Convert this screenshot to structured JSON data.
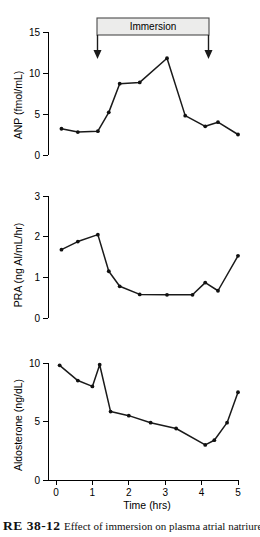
{
  "figure": {
    "caption_number": "RE 38-12",
    "caption_body": "Effect of immersion on plasma atrial natriuretic"
  },
  "annotation": {
    "immersion_label": "Immersion",
    "immersion_start_hr": 1.15,
    "immersion_end_hr": 4.2,
    "arrow_down_icon": "arrow-down-icon"
  },
  "shared_axis": {
    "xlabel": "Time (hrs)",
    "xticks": [
      0,
      1,
      2,
      3,
      4,
      5
    ],
    "xlim": [
      0,
      5
    ]
  },
  "chart_data": [
    {
      "type": "line",
      "title": "",
      "panel": "ANP",
      "xlabel": "",
      "ylabel": "ANP (fmol/mL)",
      "ylim": [
        0,
        15
      ],
      "yticks": [
        0,
        5,
        10,
        15
      ],
      "xlim": [
        0,
        5
      ],
      "grid": false,
      "legend": "none",
      "x": [
        0.15,
        0.6,
        1.15,
        1.45,
        1.75,
        2.3,
        3.05,
        3.55,
        4.1,
        4.45,
        5.0
      ],
      "values": [
        3.2,
        2.8,
        2.9,
        5.2,
        8.7,
        8.85,
        11.8,
        4.8,
        3.5,
        4.0,
        2.5
      ]
    },
    {
      "type": "line",
      "title": "",
      "panel": "PRA",
      "xlabel": "",
      "ylabel": "PRA (ng AI/mL/hr)",
      "ylim": [
        0,
        3
      ],
      "yticks": [
        0,
        1,
        2,
        3
      ],
      "xlim": [
        0,
        5
      ],
      "grid": false,
      "legend": "none",
      "x": [
        0.15,
        0.6,
        1.15,
        1.45,
        1.75,
        2.3,
        3.05,
        3.75,
        4.1,
        4.45,
        5.0
      ],
      "values": [
        1.68,
        1.88,
        2.05,
        1.15,
        0.78,
        0.58,
        0.57,
        0.57,
        0.87,
        0.67,
        1.53,
        1.53
      ]
    },
    {
      "type": "line",
      "title": "",
      "panel": "Aldosterone",
      "xlabel": "",
      "ylabel": "Aldosterone (ng/dL)",
      "ylim": [
        0,
        10
      ],
      "yticks": [
        0,
        5,
        10
      ],
      "xlim": [
        0,
        5
      ],
      "grid": false,
      "legend": "none",
      "x": [
        0.1,
        0.6,
        1.0,
        1.2,
        1.5,
        2.0,
        2.6,
        3.3,
        4.1,
        4.35,
        4.7,
        5.0
      ],
      "values": [
        9.8,
        8.5,
        8.0,
        9.85,
        5.85,
        5.5,
        4.9,
        4.4,
        3.0,
        3.4,
        4.9,
        7.5
      ]
    }
  ]
}
